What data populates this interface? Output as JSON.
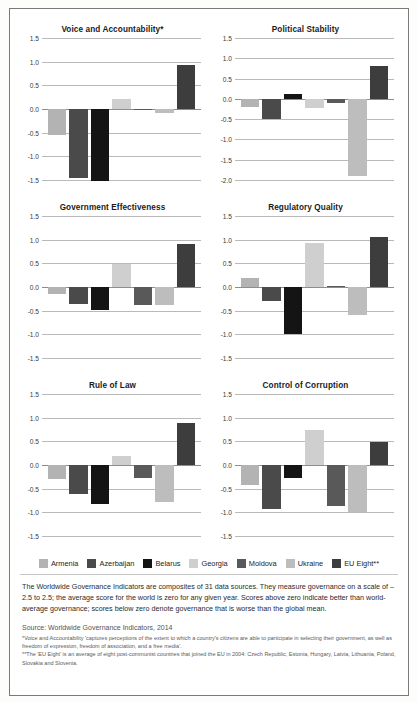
{
  "legend": {
    "items": [
      {
        "label": "Armenia",
        "color": "#b3b3b3"
      },
      {
        "label": "Azerbaijan",
        "color": "#4a4a4a"
      },
      {
        "label": "Belarus",
        "color": "#141414"
      },
      {
        "label": "Georgia",
        "color": "#cfcfcf"
      },
      {
        "label": "Moldova",
        "color": "#595959"
      },
      {
        "label": "Ukraine",
        "color": "#bdbdbd"
      },
      {
        "label": "EU Eight**",
        "color": "#3d3d3d"
      }
    ]
  },
  "note": "The Worldwide Governance Indicators are composites of 31 data sources. They measure governance on a scale of –2.5 to 2.5; the average score for the world is zero for any given year. Scores above zero indicate better than world-average governance; scores below zero denote governance that is worse than the global mean.",
  "source": "Source: Worldwide Governance Indicators, 2014",
  "footnotes": [
    "*Voice and Accountability 'captures perceptions of the extent to which a country's citizens are able to participate in selecting their government, as well as freedom of expression, freedom of association, and a free media'.",
    "**The 'EU Eight' is an average of eight post-communist countries that joined the EU in 2004: Czech Republic, Estonia, Hungary, Latvia, Lithuania, Poland, Slovakia and Slovenia."
  ],
  "chart_data": [
    {
      "type": "bar",
      "title": "Voice and Accountability*",
      "xlabel": "",
      "ylabel": "",
      "ylim": [
        -1.5,
        1.5
      ],
      "yticks": [
        1.5,
        1.0,
        0.5,
        0.0,
        -0.5,
        -1.0,
        -1.5
      ],
      "ytick_labels": [
        "1.5",
        "1.0",
        "0.5",
        "0.0",
        "-0.5",
        "-1.0",
        "-1.5"
      ],
      "grid": true,
      "legend_position": "bottom",
      "categories": [
        "Armenia",
        "Azerbaijan",
        "Belarus",
        "Georgia",
        "Moldova",
        "Ukraine",
        "EU Eight**"
      ],
      "values": [
        -0.55,
        -1.45,
        -1.52,
        0.22,
        -0.02,
        -0.08,
        0.93
      ]
    },
    {
      "type": "bar",
      "title": "Political Stability",
      "xlabel": "",
      "ylabel": "",
      "ylim": [
        -2.0,
        1.5
      ],
      "yticks": [
        1.5,
        1.0,
        0.5,
        0.0,
        -0.5,
        -1.0,
        -1.5,
        -2.0
      ],
      "ytick_labels": [
        "1.5",
        "1.0",
        "0.5",
        "0.0",
        "-0.5",
        "-1.0",
        "-1.5",
        "-2.0"
      ],
      "grid": true,
      "legend_position": "bottom",
      "categories": [
        "Armenia",
        "Azerbaijan",
        "Belarus",
        "Georgia",
        "Moldova",
        "Ukraine",
        "EU Eight**"
      ],
      "values": [
        -0.2,
        -0.5,
        0.12,
        -0.22,
        -0.1,
        -1.9,
        0.8
      ]
    },
    {
      "type": "bar",
      "title": "Government Effectiveness",
      "xlabel": "",
      "ylabel": "",
      "ylim": [
        -1.5,
        1.5
      ],
      "yticks": [
        1.5,
        1.0,
        0.5,
        0.0,
        -0.5,
        -1.0,
        -1.5
      ],
      "ytick_labels": [
        "1.5",
        "1.0",
        "0.5",
        "0.0",
        "-0.5",
        "-1.0",
        "-1.5"
      ],
      "grid": true,
      "legend_position": "bottom",
      "categories": [
        "Armenia",
        "Azerbaijan",
        "Belarus",
        "Georgia",
        "Moldova",
        "Ukraine",
        "EU Eight**"
      ],
      "values": [
        -0.15,
        -0.35,
        -0.48,
        0.48,
        -0.37,
        -0.38,
        0.9
      ]
    },
    {
      "type": "bar",
      "title": "Regulatory Quality",
      "xlabel": "",
      "ylabel": "",
      "ylim": [
        -1.5,
        1.5
      ],
      "yticks": [
        1.5,
        1.0,
        0.5,
        0.0,
        -0.5,
        -1.0,
        -1.5
      ],
      "ytick_labels": [
        "1.5",
        "1.0",
        "0.5",
        "0.0",
        "-0.5",
        "-1.0",
        "-1.5"
      ],
      "grid": true,
      "legend_position": "bottom",
      "categories": [
        "Armenia",
        "Azerbaijan",
        "Belarus",
        "Georgia",
        "Moldova",
        "Ukraine",
        "EU Eight**"
      ],
      "values": [
        0.2,
        -0.3,
        -1.0,
        0.93,
        0.02,
        -0.6,
        1.05
      ]
    },
    {
      "type": "bar",
      "title": "Rule of Law",
      "xlabel": "",
      "ylabel": "",
      "ylim": [
        -1.5,
        1.5
      ],
      "yticks": [
        1.5,
        1.0,
        0.5,
        0.0,
        -0.5,
        -1.0,
        -1.5
      ],
      "ytick_labels": [
        "1.5",
        "1.0",
        "0.5",
        "0.0",
        "-0.5",
        "-1.0",
        "-1.5"
      ],
      "grid": true,
      "legend_position": "bottom",
      "categories": [
        "Armenia",
        "Azerbaijan",
        "Belarus",
        "Georgia",
        "Moldova",
        "Ukraine",
        "EU Eight**"
      ],
      "values": [
        -0.3,
        -0.62,
        -0.82,
        0.2,
        -0.28,
        -0.78,
        0.88
      ]
    },
    {
      "type": "bar",
      "title": "Control of Corruption",
      "xlabel": "",
      "ylabel": "",
      "ylim": [
        -1.5,
        1.5
      ],
      "yticks": [
        1.5,
        1.0,
        0.5,
        0.0,
        -0.5,
        -1.0,
        -1.5
      ],
      "ytick_labels": [
        "1.5",
        "1.0",
        "0.5",
        "0.0",
        "-0.5",
        "-1.0",
        "-1.5"
      ],
      "grid": true,
      "legend_position": "bottom",
      "categories": [
        "Armenia",
        "Azerbaijan",
        "Belarus",
        "Georgia",
        "Moldova",
        "Ukraine",
        "EU Eight**"
      ],
      "values": [
        -0.43,
        -0.92,
        -0.28,
        0.73,
        -0.87,
        -1.0,
        0.48
      ]
    }
  ]
}
